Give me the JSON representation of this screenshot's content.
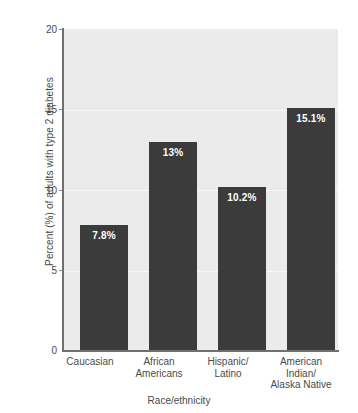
{
  "chart_data": {
    "type": "bar",
    "title": "",
    "xlabel": "Race/ethnicity",
    "ylabel": "Percent (%) of adults with type 2 diabetes",
    "categories": [
      "Caucasian",
      "African\nAmericans",
      "Hispanic/\nLatino",
      "American\nIndian/\nAlaska Native"
    ],
    "values": [
      7.8,
      13,
      10.2,
      15.1
    ],
    "value_labels": [
      "7.8%",
      "13%",
      "10.2%",
      "15.1%"
    ],
    "ylim": [
      0,
      20
    ],
    "yticks": [
      0,
      5,
      10,
      15,
      20
    ],
    "ytick_labels": [
      "0",
      "5",
      "10",
      "15",
      "20"
    ],
    "grid": true,
    "legend": "none",
    "colors": {
      "bar": "#3b3b3b",
      "plot_background": "#ebebeb",
      "gridline": "#f7f7f7",
      "axis": "#6f6f6f",
      "text": "#4a4a4a",
      "value_label": "#ffffff",
      "figure_background": "#ffffff"
    }
  }
}
